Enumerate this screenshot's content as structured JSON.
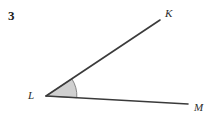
{
  "figure": {
    "problem_number": "3",
    "background_color": "#ffffff",
    "stroke_color": "#3a3a3a",
    "sector_fill_color": "#d0d0d0",
    "sector_stroke_color": "#7a7a7a",
    "width": 218,
    "height": 119,
    "vertex_label": "L",
    "ray_end_labels": [
      "K",
      "M"
    ],
    "points": {
      "L": {
        "label": "L",
        "x": 46,
        "y": 96
      },
      "K": {
        "label": "K",
        "x": 160,
        "y": 20
      },
      "M": {
        "label": "M",
        "x": 188,
        "y": 104
      }
    },
    "rays": [
      {
        "name": "ray-LK",
        "from": "L",
        "to": "K",
        "d": "M 46 96 L 160 20"
      },
      {
        "name": "ray-LM",
        "from": "L",
        "to": "M",
        "d": "M 46 96 L 188 104"
      }
    ],
    "angle_sector": {
      "name": "angle-KLM",
      "vertex": "L",
      "radius": 31,
      "d": "M 46 96 L 71.8 78.8 A 31 31 0 0 1 76.8 97.7 Z"
    }
  }
}
